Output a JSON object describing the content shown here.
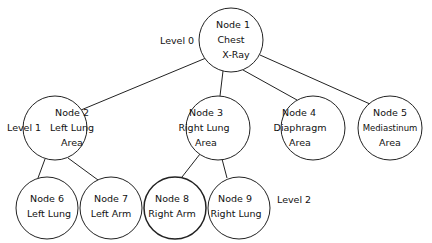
{
  "diagram": {
    "type": "tree",
    "levels": [
      {
        "label": "Level 0"
      },
      {
        "label": "Level 1"
      },
      {
        "label": "Level 2"
      }
    ],
    "nodes": [
      {
        "id": "node1",
        "lines": [
          "Node 1",
          "Chest",
          "X-Ray"
        ]
      },
      {
        "id": "node2",
        "lines": [
          "Node 2",
          "Left Lung",
          "Area"
        ]
      },
      {
        "id": "node3",
        "lines": [
          "Node 3",
          "Right Lung",
          "Area"
        ]
      },
      {
        "id": "node4",
        "lines": [
          "Node 4",
          "Diaphragm",
          "Area"
        ]
      },
      {
        "id": "node5",
        "lines": [
          "Node 5",
          "Mediastinum",
          "Area"
        ]
      },
      {
        "id": "node6",
        "lines": [
          "Node 6",
          "Left Lung"
        ]
      },
      {
        "id": "node7",
        "lines": [
          "Node 7",
          "Left Arm"
        ]
      },
      {
        "id": "node8",
        "lines": [
          "Node 8",
          "Right Arm"
        ]
      },
      {
        "id": "node9",
        "lines": [
          "Node 9",
          "Right Lung"
        ]
      }
    ],
    "edges": [
      [
        "node1",
        "node2"
      ],
      [
        "node1",
        "node3"
      ],
      [
        "node1",
        "node4"
      ],
      [
        "node1",
        "node5"
      ],
      [
        "node2",
        "node6"
      ],
      [
        "node2",
        "node7"
      ],
      [
        "node3",
        "node8"
      ],
      [
        "node3",
        "node9"
      ]
    ]
  }
}
